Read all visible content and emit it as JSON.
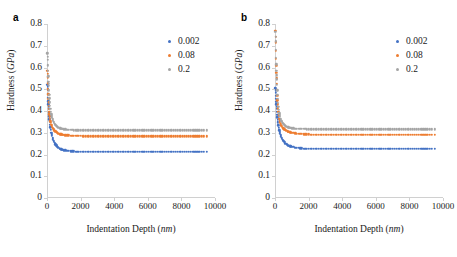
{
  "figure": {
    "panels": [
      {
        "label": "a",
        "axis": {
          "xlabel_text": "Indentation Depth (",
          "xlabel_unit": "nm",
          "xlabel_close": ")",
          "ylabel_text": "Hardness (",
          "ylabel_unit": "GPa",
          "ylabel_close": ")",
          "xticks": [
            "0",
            "2000",
            "4000",
            "6000",
            "8000",
            "10000"
          ],
          "yticks": [
            "0",
            "0.1",
            "0.2",
            "0.3",
            "0.4",
            "0.5",
            "0.6",
            "0.7",
            "0.8"
          ]
        },
        "legend": [
          {
            "label": "0.002",
            "color": "#4472C4"
          },
          {
            "label": "0.08",
            "color": "#ED7D31"
          },
          {
            "label": "0.2",
            "color": "#A5A5A5"
          }
        ]
      },
      {
        "label": "b",
        "axis": {
          "xlabel_text": "Indentation Depth (",
          "xlabel_unit": "nm",
          "xlabel_close": ")",
          "ylabel_text": "Hardness (",
          "ylabel_unit": "GPa",
          "ylabel_close": ")",
          "xticks": [
            "0",
            "2000",
            "4000",
            "6000",
            "8000",
            "10000"
          ],
          "yticks": [
            "0",
            "0.1",
            "0.2",
            "0.3",
            "0.4",
            "0.5",
            "0.6",
            "0.7",
            "0.8"
          ]
        },
        "legend": [
          {
            "label": "0.002",
            "color": "#4472C4"
          },
          {
            "label": "0.08",
            "color": "#ED7D31"
          },
          {
            "label": "0.2",
            "color": "#A5A5A5"
          }
        ]
      }
    ]
  },
  "chart_data": [
    {
      "type": "scatter",
      "panel": "a",
      "title": "",
      "xlabel": "Indentation Depth (nm)",
      "ylabel": "Hardness (GPa)",
      "xlim": [
        0,
        10000
      ],
      "ylim": [
        0,
        0.8
      ],
      "xticks": [
        0,
        2000,
        4000,
        6000,
        8000,
        10000
      ],
      "yticks": [
        0,
        0.1,
        0.2,
        0.3,
        0.4,
        0.5,
        0.6,
        0.7,
        0.8
      ],
      "grid": false,
      "legend_position": "upper right",
      "series": [
        {
          "name": "0.002",
          "color": "#4472C4",
          "x": [
            20,
            40,
            60,
            80,
            100,
            130,
            160,
            200,
            250,
            300,
            360,
            420,
            500,
            600,
            700,
            800,
            900,
            1000,
            1200,
            1400,
            1600,
            1800,
            2000,
            2300,
            2600,
            2900,
            3200,
            3500,
            3800,
            4100,
            4400,
            4700,
            5000,
            5400,
            5800,
            6200,
            6600,
            7000,
            7400,
            7800,
            8200,
            8700,
            9200,
            9500
          ],
          "y": [
            0.52,
            0.5,
            0.46,
            0.43,
            0.41,
            0.375,
            0.35,
            0.325,
            0.3,
            0.285,
            0.27,
            0.258,
            0.247,
            0.237,
            0.23,
            0.225,
            0.222,
            0.22,
            0.217,
            0.215,
            0.214,
            0.213,
            0.213,
            0.212,
            0.212,
            0.212,
            0.212,
            0.212,
            0.212,
            0.212,
            0.212,
            0.212,
            0.212,
            0.212,
            0.212,
            0.212,
            0.212,
            0.212,
            0.212,
            0.212,
            0.212,
            0.212,
            0.212,
            0.212
          ]
        },
        {
          "name": "0.08",
          "color": "#ED7D31",
          "x": [
            20,
            40,
            60,
            80,
            100,
            130,
            160,
            200,
            250,
            300,
            360,
            420,
            500,
            600,
            700,
            800,
            900,
            1000,
            1200,
            1400,
            1600,
            1800,
            2000,
            2300,
            2600,
            2900,
            3200,
            3500,
            3800,
            4100,
            4400,
            4700,
            5000,
            5400,
            5800,
            6200,
            6600,
            7000,
            7400,
            7800,
            8200,
            8700,
            9200,
            9500
          ],
          "y": [
            0.585,
            0.555,
            0.5,
            0.455,
            0.425,
            0.395,
            0.375,
            0.353,
            0.337,
            0.327,
            0.318,
            0.312,
            0.306,
            0.3,
            0.296,
            0.293,
            0.291,
            0.29,
            0.288,
            0.287,
            0.286,
            0.285,
            0.285,
            0.284,
            0.284,
            0.284,
            0.284,
            0.284,
            0.284,
            0.284,
            0.284,
            0.284,
            0.284,
            0.284,
            0.284,
            0.284,
            0.284,
            0.284,
            0.284,
            0.284,
            0.284,
            0.284,
            0.284,
            0.284
          ]
        },
        {
          "name": "0.2",
          "color": "#A5A5A5",
          "x": [
            20,
            40,
            60,
            80,
            100,
            130,
            160,
            200,
            250,
            300,
            360,
            420,
            500,
            600,
            700,
            800,
            900,
            1000,
            1200,
            1400,
            1600,
            1800,
            2000,
            2300,
            2600,
            2900,
            3200,
            3500,
            3800,
            4100,
            4400,
            4700,
            5000,
            5400,
            5800,
            6200,
            6600,
            7000,
            7400,
            7800,
            8200,
            8700,
            9200,
            9500
          ],
          "y": [
            0.665,
            0.635,
            0.585,
            0.535,
            0.515,
            0.475,
            0.44,
            0.41,
            0.385,
            0.368,
            0.355,
            0.345,
            0.337,
            0.328,
            0.323,
            0.32,
            0.318,
            0.316,
            0.314,
            0.313,
            0.312,
            0.312,
            0.311,
            0.311,
            0.311,
            0.311,
            0.311,
            0.311,
            0.311,
            0.311,
            0.311,
            0.311,
            0.311,
            0.311,
            0.311,
            0.311,
            0.311,
            0.311,
            0.311,
            0.311,
            0.311,
            0.311,
            0.311,
            0.311
          ]
        }
      ]
    },
    {
      "type": "scatter",
      "panel": "b",
      "title": "",
      "xlabel": "Indentation Depth (nm)",
      "ylabel": "Hardness (GPa)",
      "xlim": [
        0,
        10000
      ],
      "ylim": [
        0,
        0.8
      ],
      "xticks": [
        0,
        2000,
        4000,
        6000,
        8000,
        10000
      ],
      "yticks": [
        0,
        0.1,
        0.2,
        0.3,
        0.4,
        0.5,
        0.6,
        0.7,
        0.8
      ],
      "grid": false,
      "legend_position": "upper right",
      "series": [
        {
          "name": "0.002",
          "color": "#4472C4",
          "x": [
            20,
            40,
            60,
            80,
            100,
            130,
            160,
            200,
            250,
            300,
            360,
            420,
            500,
            600,
            700,
            800,
            900,
            1000,
            1200,
            1400,
            1600,
            1800,
            2000,
            2300,
            2600,
            2900,
            3200,
            3500,
            3800,
            4100,
            4400,
            4700,
            5000,
            5400,
            5800,
            6200,
            6600,
            7000,
            7400,
            7800,
            8200,
            8700,
            9200,
            9500
          ],
          "y": [
            0.505,
            0.485,
            0.455,
            0.43,
            0.41,
            0.383,
            0.36,
            0.335,
            0.312,
            0.297,
            0.283,
            0.272,
            0.262,
            0.252,
            0.246,
            0.241,
            0.238,
            0.236,
            0.232,
            0.23,
            0.228,
            0.227,
            0.227,
            0.226,
            0.226,
            0.225,
            0.225,
            0.225,
            0.225,
            0.225,
            0.225,
            0.225,
            0.225,
            0.225,
            0.225,
            0.225,
            0.225,
            0.225,
            0.225,
            0.225,
            0.225,
            0.225,
            0.225,
            0.225
          ]
        },
        {
          "name": "0.08",
          "color": "#ED7D31",
          "x": [
            20,
            40,
            60,
            80,
            100,
            130,
            160,
            200,
            250,
            300,
            360,
            420,
            500,
            600,
            700,
            800,
            900,
            1000,
            1200,
            1400,
            1600,
            1800,
            2000,
            2300,
            2600,
            2900,
            3200,
            3500,
            3800,
            4100,
            4400,
            4700,
            5000,
            5400,
            5800,
            6200,
            6600,
            7000,
            7400,
            7800,
            8200,
            8700,
            9200,
            9500
          ],
          "y": [
            0.77,
            0.715,
            0.64,
            0.575,
            0.525,
            0.47,
            0.43,
            0.395,
            0.365,
            0.348,
            0.335,
            0.327,
            0.32,
            0.313,
            0.308,
            0.305,
            0.302,
            0.3,
            0.297,
            0.295,
            0.294,
            0.293,
            0.292,
            0.291,
            0.291,
            0.29,
            0.29,
            0.29,
            0.29,
            0.29,
            0.29,
            0.29,
            0.29,
            0.29,
            0.29,
            0.29,
            0.29,
            0.29,
            0.29,
            0.29,
            0.29,
            0.29,
            0.29,
            0.29
          ]
        },
        {
          "name": "0.2",
          "color": "#A5A5A5",
          "x": [
            20,
            40,
            60,
            80,
            100,
            130,
            160,
            200,
            250,
            300,
            360,
            420,
            500,
            600,
            700,
            800,
            900,
            1000,
            1200,
            1400,
            1600,
            1800,
            2000,
            2300,
            2600,
            2900,
            3200,
            3500,
            3800,
            4100,
            4400,
            4700,
            5000,
            5400,
            5800,
            6200,
            6600,
            7000,
            7400,
            7800,
            8200,
            8700,
            9200,
            9500
          ],
          "y": [
            0.765,
            0.72,
            0.645,
            0.585,
            0.545,
            0.495,
            0.455,
            0.42,
            0.39,
            0.372,
            0.358,
            0.349,
            0.341,
            0.333,
            0.328,
            0.325,
            0.323,
            0.321,
            0.319,
            0.318,
            0.317,
            0.317,
            0.316,
            0.316,
            0.316,
            0.316,
            0.316,
            0.316,
            0.316,
            0.316,
            0.316,
            0.316,
            0.316,
            0.316,
            0.316,
            0.316,
            0.316,
            0.316,
            0.316,
            0.316,
            0.316,
            0.316,
            0.316,
            0.316
          ]
        }
      ]
    }
  ]
}
